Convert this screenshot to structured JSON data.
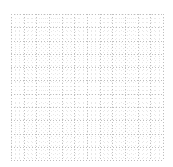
{
  "canvas": {
    "width": 173,
    "height": 167,
    "background_color": "#ffffff",
    "label": "dotted-grid-canvas"
  },
  "grid": {
    "origin_x": 11,
    "origin_y": 14,
    "width": 152,
    "height": 146,
    "major_spacing": 12.65,
    "minor_divisions": 3,
    "major_color": "#bfbfbf",
    "minor_color": "#e8e8e8",
    "dash_on": 1,
    "dash_off": 2,
    "columns": 12,
    "rows": 11,
    "style": "dotted",
    "major_x_positions": [
      11,
      23.7,
      36.3,
      49,
      61.6,
      74.3,
      86.9,
      99.6,
      112.2,
      124.9,
      137.5,
      150.2,
      162.8
    ],
    "major_y_positions": [
      14,
      27.3,
      40.6,
      53.8,
      67.1,
      80.4,
      93.6,
      106.9,
      120.2,
      133.5,
      146.7,
      160
    ]
  }
}
